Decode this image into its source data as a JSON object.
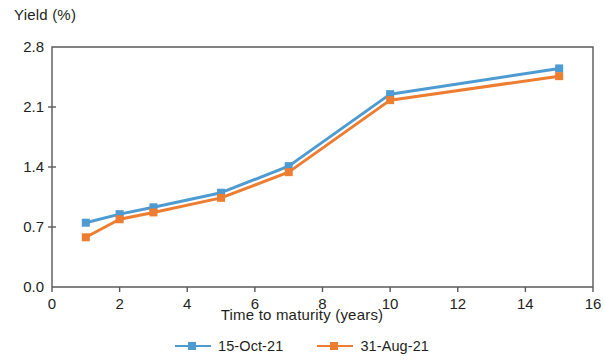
{
  "chart_data": {
    "type": "line",
    "title": "",
    "ylabel": "Yield (%)",
    "xlabel": "Time to maturity (years)",
    "xlim": [
      0,
      16
    ],
    "ylim": [
      0.0,
      2.8
    ],
    "xticks": [
      "0",
      "2",
      "4",
      "6",
      "8",
      "10",
      "12",
      "14",
      "16"
    ],
    "xtick_values": [
      0,
      2,
      4,
      6,
      8,
      10,
      12,
      14,
      16
    ],
    "yticks": [
      "0.0",
      "0.7",
      "1.4",
      "2.1",
      "2.8"
    ],
    "ytick_values": [
      0.0,
      0.7,
      1.4,
      2.1,
      2.8
    ],
    "grid": false,
    "legend_position": "bottom-center",
    "x": [
      1,
      2,
      3,
      5,
      7,
      10,
      15
    ],
    "series": [
      {
        "name": "15-Oct-21",
        "color": "#4E9BD1",
        "marker": "square",
        "values": [
          0.75,
          0.85,
          0.93,
          1.1,
          1.41,
          2.25,
          2.55
        ]
      },
      {
        "name": "31-Aug-21",
        "color": "#ED7D31",
        "marker": "square",
        "values": [
          0.58,
          0.79,
          0.87,
          1.04,
          1.34,
          2.18,
          2.46
        ]
      }
    ]
  },
  "axis": {
    "frame_color": "#58595b"
  },
  "legend": {
    "entries": [
      {
        "label": "15-Oct-21",
        "color": "#4E9BD1"
      },
      {
        "label": "31-Aug-21",
        "color": "#ED7D31"
      }
    ]
  }
}
